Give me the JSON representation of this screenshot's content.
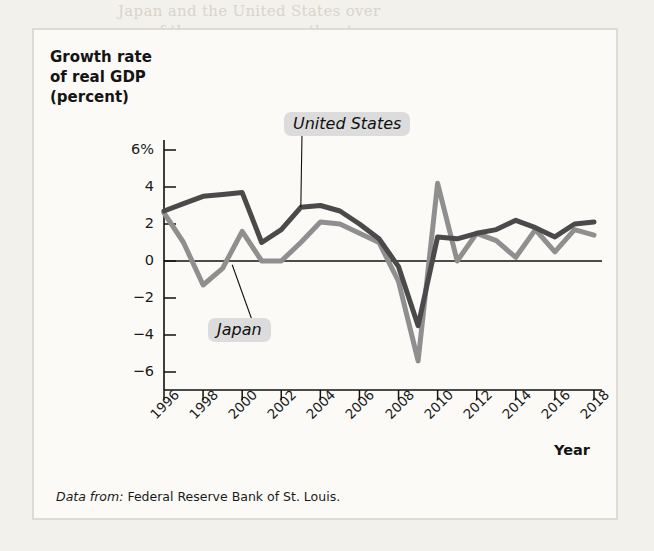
{
  "figure": {
    "y_axis_title_lines": [
      "Growth rate",
      "of real GDP",
      "(percent)"
    ],
    "x_axis_title": "Year",
    "source_prefix": "Data from:",
    "source_text": "Federal Reserve Bank of St. Louis.",
    "label_united_states": "United States",
    "label_japan": "Japan"
  },
  "chart_data": {
    "type": "line",
    "title": "",
    "xlabel": "Year",
    "ylabel": "Growth rate of real GDP (percent)",
    "xlim": [
      1996,
      2018
    ],
    "ylim": [
      -6,
      6
    ],
    "yticks": [
      6,
      4,
      2,
      0,
      -2,
      -4,
      -6
    ],
    "ytick_labels": [
      "6%",
      "4",
      "2",
      "0",
      "−2",
      "−4",
      "−6"
    ],
    "xticks": [
      1996,
      1998,
      2000,
      2002,
      2004,
      2006,
      2008,
      2010,
      2012,
      2014,
      2016,
      2018
    ],
    "xtick_labels": [
      "1996",
      "1998",
      "2000",
      "2002",
      "2004",
      "2006",
      "2008",
      "2010",
      "2012",
      "2014",
      "2016",
      "2018"
    ],
    "grid": false,
    "legend_position": "inline-annotations",
    "x": [
      1996,
      1997,
      1998,
      1999,
      2000,
      2001,
      2002,
      2003,
      2004,
      2005,
      2006,
      2007,
      2008,
      2009,
      2010,
      2011,
      2012,
      2013,
      2014,
      2015,
      2016,
      2017,
      2018
    ],
    "series": [
      {
        "name": "United States",
        "color": "#4a4a4a",
        "values": [
          2.7,
          3.1,
          3.5,
          3.6,
          3.7,
          1.0,
          1.7,
          2.9,
          3.0,
          2.7,
          2.0,
          1.2,
          -0.3,
          -3.5,
          1.3,
          1.2,
          1.5,
          1.7,
          2.2,
          1.8,
          1.3,
          2.0,
          2.1
        ]
      },
      {
        "name": "Japan",
        "color": "#8f8f8f",
        "values": [
          2.6,
          1.0,
          -1.3,
          -0.4,
          1.6,
          0.0,
          0.0,
          1.0,
          2.1,
          2.0,
          1.5,
          1.0,
          -1.1,
          -5.4,
          4.2,
          0.0,
          1.5,
          1.1,
          0.2,
          1.7,
          0.5,
          1.7,
          1.4
        ]
      }
    ],
    "annotations": [
      {
        "text": "United States",
        "points_to_year": 2003,
        "points_to_value": 2.9
      },
      {
        "text": "Japan",
        "points_to_year": 2000,
        "points_to_value": -0.4
      }
    ]
  },
  "bleed_through": [
    {
      "text": "Japan and the United States over",
      "x": 118,
      "y": 2
    },
    {
      "text": "of the average growth rates",
      "x": 150,
      "y": 22
    },
    {
      "text": "in the whole",
      "x": 175,
      "y": 40
    },
    {
      "text": "means that one had per capital income",
      "x": 100,
      "y": 58
    },
    {
      "text": "other nation's standard of living",
      "x": 135,
      "y": 78
    },
    {
      "text": "In addition to long-run growth",
      "x": 162,
      "y": 120
    },
    {
      "text": "business cycles that an economy",
      "x": 178,
      "y": 140
    },
    {
      "text": "economic relationship between",
      "x": 178,
      "y": 160
    },
    {
      "text": "slowdown in the rate at",
      "x": 168,
      "y": 185
    },
    {
      "text": "has a recession in the case",
      "x": 190,
      "y": 205
    },
    {
      "text": "which of the major economies",
      "x": 170,
      "y": 222
    },
    {
      "text": "also tended to differ among",
      "x": 188,
      "y": 250
    },
    {
      "text": "the economic data",
      "x": 200,
      "y": 275
    },
    {
      "text": "and recovery in",
      "x": 196,
      "y": 298
    },
    {
      "text": "of the short-run",
      "x": 200,
      "y": 322
    },
    {
      "text": "growth and cycles",
      "x": 176,
      "y": 345
    },
    {
      "text": "reported in the long term",
      "x": 180,
      "y": 368
    },
    {
      "text": "performance of the economy",
      "x": 160,
      "y": 392
    },
    {
      "text": "economic analysis and the",
      "x": 170,
      "y": 415
    },
    {
      "text": "aggregate fluctuations",
      "x": 186,
      "y": 438
    },
    {
      "text": "for the economy",
      "x": 200,
      "y": 460
    },
    {
      "text": "the data series",
      "x": 210,
      "y": 482
    }
  ]
}
